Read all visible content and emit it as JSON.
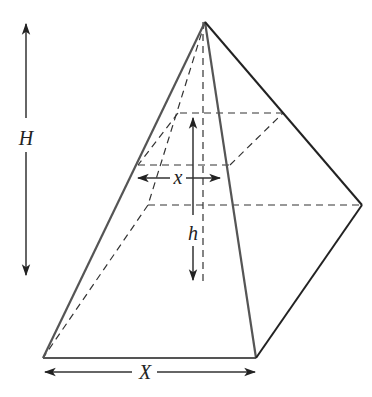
{
  "figure": {
    "type": "pyramid-cross-section-diagram",
    "labels": {
      "total_height": "H",
      "section_height": "h",
      "section_width": "x",
      "base_width": "X"
    },
    "colors": {
      "background": "#ffffff",
      "solid_edge": "#555555",
      "dashed_edge": "#333333",
      "text": "#222222"
    }
  }
}
